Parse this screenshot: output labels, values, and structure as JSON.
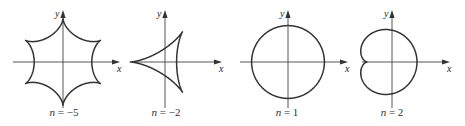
{
  "figure": {
    "axis_labels": {
      "x": "x",
      "y": "y"
    },
    "panels": [
      {
        "id": "n-minus-5",
        "n": -5,
        "caption_var": "n",
        "caption_eq": " = ",
        "caption_val": "−5",
        "shape": "five-lobed loop curve",
        "cx": 63,
        "cy": 62,
        "scale": 7.2,
        "xaxis": [
          13,
          120
        ],
        "yaxis": [
          10,
          108
        ]
      },
      {
        "id": "n-minus-2",
        "n": -2,
        "caption_var": "n",
        "caption_eq": " = ",
        "caption_val": "−2",
        "shape": "deltoid",
        "cx": 165,
        "cy": 62,
        "scale": 11.6,
        "xaxis": [
          135,
          222
        ],
        "yaxis": [
          10,
          108
        ]
      },
      {
        "id": "n-1",
        "n": 1,
        "caption_var": "n",
        "caption_eq": " = ",
        "caption_val": "1",
        "shape": "circle",
        "cx": 288,
        "cy": 62,
        "scale": 18.2,
        "xaxis": [
          240,
          348
        ],
        "yaxis": [
          10,
          108
        ]
      },
      {
        "id": "n-2",
        "n": 2,
        "caption_var": "n",
        "caption_eq": " = ",
        "caption_val": "2",
        "shape": "cardioid-like",
        "cx": 392,
        "cy": 62,
        "scale": 12.5,
        "xaxis": [
          362,
          450
        ],
        "yaxis": [
          10,
          108
        ]
      }
    ],
    "caption_y": 106
  }
}
